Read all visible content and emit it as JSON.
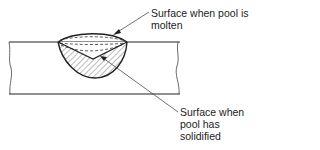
{
  "diagram": {
    "labels": {
      "molten": {
        "lines": [
          "Surface when pool is",
          "molten"
        ]
      },
      "solidified": {
        "lines": [
          "Surface when",
          "pool has",
          "solidified"
        ]
      }
    },
    "colors": {
      "stroke": "#222222",
      "hatch": "#555555",
      "background": "#ffffff"
    }
  }
}
